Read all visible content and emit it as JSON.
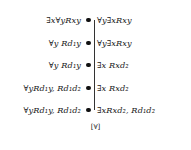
{
  "figure": {
    "type": "linear-order-diagram",
    "orientation": "vertical",
    "node_count": 5,
    "bottom_label": "[∀]",
    "node_color": "#111111",
    "line_color": "#333333",
    "background": "#ffffff",
    "rows": [
      {
        "left": "∃x∀yRxy",
        "right": "∀y∃xRxy",
        "node": "●"
      },
      {
        "left": "∀y Rd₁y",
        "right": "∀y∃xRxy",
        "node": "●"
      },
      {
        "left": "∀y Rd₁y",
        "right": "∃x Rxd₂",
        "node": "●"
      },
      {
        "left": "∀yRd₁y, Rd₁d₂",
        "right": "∃x Rxd₂",
        "node": "●"
      },
      {
        "left": "∀yRd₁y, Rd₁d₂",
        "right": "∃xRxd₂, Rd₁d₂",
        "node": "●"
      }
    ]
  }
}
